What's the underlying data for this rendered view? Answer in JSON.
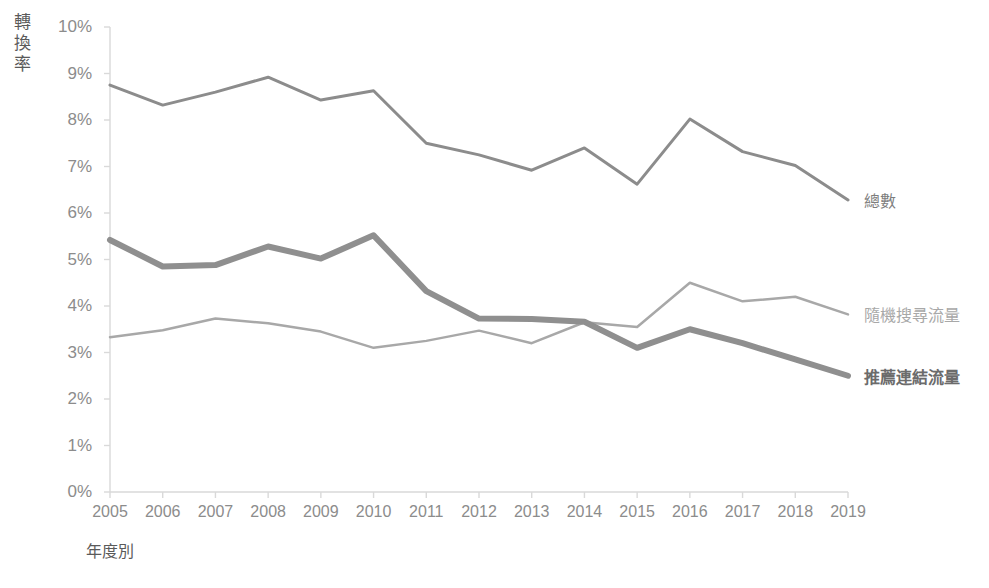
{
  "chart_data": {
    "type": "line",
    "title": "",
    "subtitle": "",
    "xlabel": "年度別",
    "ylabel": "轉換率",
    "ylabel_chars": [
      "轉",
      "換",
      "率"
    ],
    "categories": [
      "2005",
      "2006",
      "2007",
      "2008",
      "2009",
      "2010",
      "2011",
      "2012",
      "2013",
      "2014",
      "2015",
      "2016",
      "2017",
      "2018",
      "2019"
    ],
    "x": [
      2005,
      2006,
      2007,
      2008,
      2009,
      2010,
      2011,
      2012,
      2013,
      2014,
      2015,
      2016,
      2017,
      2018,
      2019
    ],
    "ylim": [
      0,
      10
    ],
    "xlim": [
      2005,
      2019
    ],
    "ytick_labels": [
      "0%",
      "1%",
      "2%",
      "3%",
      "4%",
      "5%",
      "6%",
      "7%",
      "8%",
      "9%",
      "10%"
    ],
    "ytick_values": [
      0,
      1,
      2,
      3,
      4,
      5,
      6,
      7,
      8,
      9,
      10
    ],
    "y_unit": "%",
    "grid": false,
    "legend_position": "right-inline",
    "series": [
      {
        "name": "總數",
        "color": "#8c8c8c",
        "width": 3,
        "bold_label": false,
        "values": [
          8.75,
          8.32,
          8.6,
          8.92,
          8.43,
          8.63,
          7.5,
          7.25,
          6.92,
          7.4,
          6.62,
          8.02,
          7.32,
          7.02,
          6.28
        ]
      },
      {
        "name": "隨機搜尋流量",
        "color": "#a8a8a8",
        "width": 2.5,
        "bold_label": false,
        "values": [
          3.33,
          3.48,
          3.73,
          3.63,
          3.45,
          3.1,
          3.25,
          3.47,
          3.2,
          3.65,
          3.55,
          4.5,
          4.1,
          4.2,
          3.82
        ]
      },
      {
        "name": "推薦連結流量",
        "color": "#8f8f8f",
        "width": 6,
        "bold_label": true,
        "values": [
          5.42,
          4.85,
          4.88,
          5.28,
          5.02,
          5.52,
          4.32,
          3.73,
          3.72,
          3.66,
          3.1,
          3.5,
          3.2,
          2.85,
          2.5
        ]
      }
    ],
    "annotations": []
  },
  "axis": {
    "line_color": "#d9d9d9",
    "tick_color": "#d9d9d9"
  }
}
